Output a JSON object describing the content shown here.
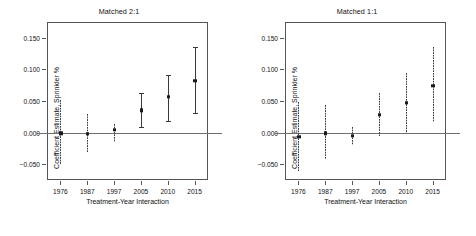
{
  "figure": {
    "width": 476,
    "height": 236,
    "background": "#ffffff",
    "line_color": "#3a3a3a",
    "zero_line_color": "#6f6f6f",
    "axis_color": "#555555"
  },
  "chart_data": [
    {
      "type": "scatter",
      "panel": "left",
      "title": "Matched 2:1",
      "xlabel": "Treatment-Year Interaction",
      "ylabel": "Coefficient Estimate, Sprinkler %",
      "categories": [
        "1976",
        "1987",
        "1997",
        "2005",
        "2010",
        "2015"
      ],
      "values": [
        -0.001,
        -0.002,
        0.004,
        0.035,
        0.057,
        0.082
      ],
      "ci_low": [
        -0.052,
        -0.032,
        -0.015,
        0.007,
        0.016,
        0.029
      ],
      "ci_high": [
        0.052,
        0.03,
        0.013,
        0.063,
        0.091,
        0.136
      ],
      "significant": [
        false,
        false,
        false,
        true,
        true,
        true
      ],
      "yticks": [
        -0.05,
        0.0,
        0.05,
        0.1,
        0.15
      ],
      "ytick_labels": [
        "-0.050",
        "0.000",
        "0.050",
        "0.100",
        "0.150"
      ],
      "ylim": [
        -0.075,
        0.175
      ],
      "grid": false,
      "legend": "none",
      "zero_reference_line": 0.0
    },
    {
      "type": "scatter",
      "panel": "right",
      "title": "Matched 1:1",
      "xlabel": "Treatment-Year Interaction",
      "ylabel": "Coefficient Estimate, Sprinkler %",
      "categories": [
        "1976",
        "1987",
        "1997",
        "2005",
        "2010",
        "2015"
      ],
      "values": [
        -0.007,
        -0.001,
        -0.005,
        0.028,
        0.047,
        0.074
      ],
      "ci_low": [
        -0.061,
        -0.041,
        -0.019,
        -0.005,
        0.0,
        0.016
      ],
      "ci_high": [
        0.049,
        0.043,
        0.009,
        0.062,
        0.095,
        0.135
      ],
      "significant": [
        false,
        false,
        false,
        false,
        false,
        false
      ],
      "yticks": [
        -0.05,
        0.0,
        0.05,
        0.1,
        0.15
      ],
      "ytick_labels": [
        "-0.050",
        "0.000",
        "0.050",
        "0.100",
        "0.150"
      ],
      "ylim": [
        -0.075,
        0.175
      ],
      "grid": false,
      "legend": "none",
      "zero_reference_line": 0.0
    }
  ]
}
